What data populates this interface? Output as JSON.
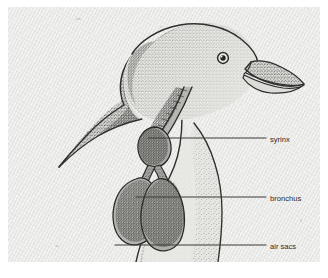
{
  "figure": {
    "technique": "stipple-pen-and-ink",
    "background_color": "#e9e9e7",
    "ink_color": "#3a3a38",
    "mount_color": "#ffffff"
  },
  "labels": [
    {
      "id": "syrinx",
      "text": "syrinx",
      "leader": {
        "x1": 140,
        "y1": 131,
        "x2": 258,
        "y2": 131
      },
      "text_x": 262,
      "text_y": 134
    },
    {
      "id": "bronchus",
      "text": "bronchus",
      "leader": {
        "x1": 128,
        "y1": 190,
        "x2": 258,
        "y2": 190
      },
      "text_x": 262,
      "text_y": 193
    },
    {
      "id": "air-sacs",
      "text": "air sacs",
      "leader": {
        "x1": 107,
        "y1": 238,
        "x2": 258,
        "y2": 238
      },
      "text_x": 262,
      "text_y": 241
    }
  ],
  "anatomy_parts": [
    {
      "id": "head",
      "name": "head"
    },
    {
      "id": "eye",
      "name": "eye"
    },
    {
      "id": "beak",
      "name": "beak"
    },
    {
      "id": "neck",
      "name": "neck"
    },
    {
      "id": "trachea",
      "name": "trachea"
    },
    {
      "id": "syrinx",
      "name": "syrinx"
    },
    {
      "id": "bronchus-left",
      "name": "bronchus"
    },
    {
      "id": "bronchus-right",
      "name": "bronchus"
    },
    {
      "id": "air-sac-front",
      "name": "air sac"
    },
    {
      "id": "air-sac-rear",
      "name": "air sac"
    },
    {
      "id": "body",
      "name": "body"
    }
  ]
}
